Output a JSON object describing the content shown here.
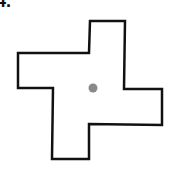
{
  "problem": {
    "number_label": "4."
  },
  "figure": {
    "shape": "pinwheel-cross",
    "outline_color": "#111111",
    "fill_color": "#ffffff",
    "stroke_width": 2.5,
    "points": "90,21 125,21 124,89 162,89 162,125 89,124 89,159 52,159 53,88 18,88 18,53 89,53",
    "center_dot": {
      "cx": 93,
      "cy": 88,
      "r": 4.5,
      "color": "#8a8a8a"
    }
  }
}
